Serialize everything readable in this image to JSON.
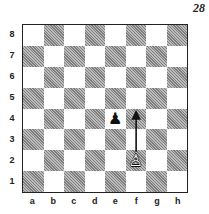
{
  "diagram_number": "28",
  "ranks": [
    "8",
    "7",
    "6",
    "5",
    "4",
    "3",
    "2",
    "1"
  ],
  "files": [
    "a",
    "b",
    "c",
    "d",
    "e",
    "f",
    "g",
    "h"
  ],
  "pieces": [
    {
      "square": "e4",
      "color": "black",
      "type": "pawn",
      "glyph": "♟"
    },
    {
      "square": "f2",
      "color": "white",
      "type": "pawn",
      "glyph": "♙"
    }
  ],
  "arrows": [
    {
      "from": "f2",
      "to": "f4"
    }
  ],
  "colors": {
    "dark_square": "#9a9a9a",
    "light_square": "#ffffff",
    "ink": "#222222"
  }
}
